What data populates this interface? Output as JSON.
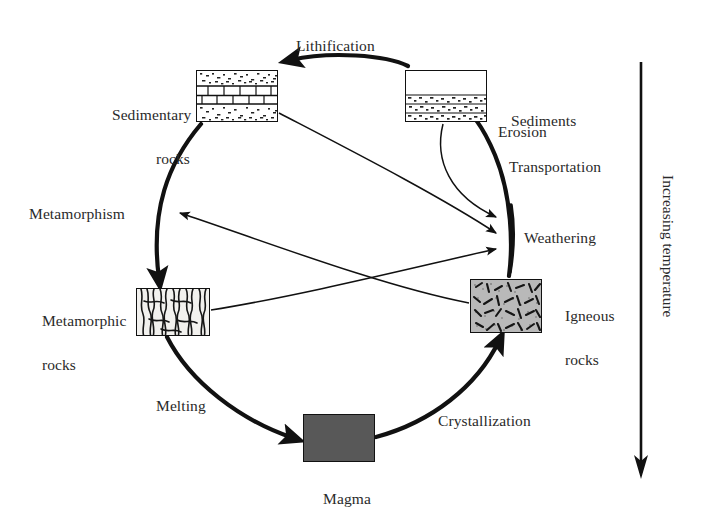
{
  "diagram": {
    "background": "#ffffff",
    "ink": "#1a1a1a"
  },
  "nodes": [
    {
      "id": "sedimentary_rocks",
      "label_line1": "Sedimentary",
      "label_line2": "rocks",
      "label_full": "Sedimentary rocks",
      "swatch": "sedimentary-strata",
      "x": 196,
      "y": 70,
      "w": 82,
      "h": 52
    },
    {
      "id": "sediments",
      "label_line1": "Sediments",
      "label_line2": "",
      "label_full": "Sediments",
      "swatch": "sediments-bands",
      "x": 405,
      "y": 70,
      "w": 82,
      "h": 52
    },
    {
      "id": "igneous_rocks",
      "label_line1": "Igneous",
      "label_line2": "rocks",
      "label_full": "Igneous rocks",
      "swatch": "igneous-speckle",
      "x": 470,
      "y": 279,
      "w": 72,
      "h": 54
    },
    {
      "id": "metamorphic_rocks",
      "label_line1": "Metamorphic",
      "label_line2": "rocks",
      "label_full": "Metamorphic rocks",
      "swatch": "metamorphic-foliation",
      "x": 136,
      "y": 288,
      "w": 74,
      "h": 48
    },
    {
      "id": "magma",
      "label_line1": "Magma",
      "label_line2": "",
      "label_full": "Magma",
      "swatch": "magma-solid",
      "swatch_color": "#585858",
      "x": 303,
      "y": 414,
      "w": 72,
      "h": 48
    }
  ],
  "process_labels": [
    {
      "id": "lithification",
      "text": "Lithification",
      "x": 296,
      "y": 35
    },
    {
      "id": "erosion",
      "text": "Erosion",
      "x": 498,
      "y": 121
    },
    {
      "id": "transportation",
      "text": "Transportation",
      "x": 509,
      "y": 156
    },
    {
      "id": "weathering",
      "text": "Weathering",
      "x": 524,
      "y": 227
    },
    {
      "id": "metamorphism",
      "text": "Metamorphism",
      "x": 29,
      "y": 203
    },
    {
      "id": "melting",
      "text": "Melting",
      "x": 156,
      "y": 395
    },
    {
      "id": "crystallization",
      "text": "Crystallization",
      "x": 438,
      "y": 410
    }
  ],
  "node_labels": [
    {
      "id": "sedimentary_rocks_label",
      "line1": "Sedimentary",
      "line2": "rocks",
      "x": 96,
      "y": 82,
      "align": "right",
      "width": 94
    },
    {
      "id": "sediments_label",
      "line1": "Sediments",
      "line2": "",
      "x": 495,
      "y": 88,
      "align": "left",
      "width": 120
    },
    {
      "id": "igneous_rocks_label",
      "line1": "Igneous",
      "line2": "rocks",
      "x": 549,
      "y": 283,
      "align": "left",
      "width": 90
    },
    {
      "id": "metamorphic_rocks_label",
      "line1": "Metamorphic",
      "line2": "rocks",
      "x": 26,
      "y": 288,
      "align": "left",
      "width": 106
    },
    {
      "id": "magma_label",
      "line1": "Magma",
      "line2": "",
      "x": 303,
      "y": 466,
      "align": "center",
      "width": 72
    }
  ],
  "axis": {
    "id": "temperature_axis",
    "text": "Increasing temperature",
    "direction": "down",
    "line_x": 641,
    "line_y1": 62,
    "line_y2": 478,
    "text_x": 677,
    "text_y": 175
  },
  "cycle": {
    "center_x": 355,
    "center_y": 258,
    "radius": 155,
    "steps": [
      "Lithification",
      "Metamorphism",
      "Melting",
      "Crystallization",
      "Erosion",
      "Transportation",
      "Weathering"
    ]
  }
}
